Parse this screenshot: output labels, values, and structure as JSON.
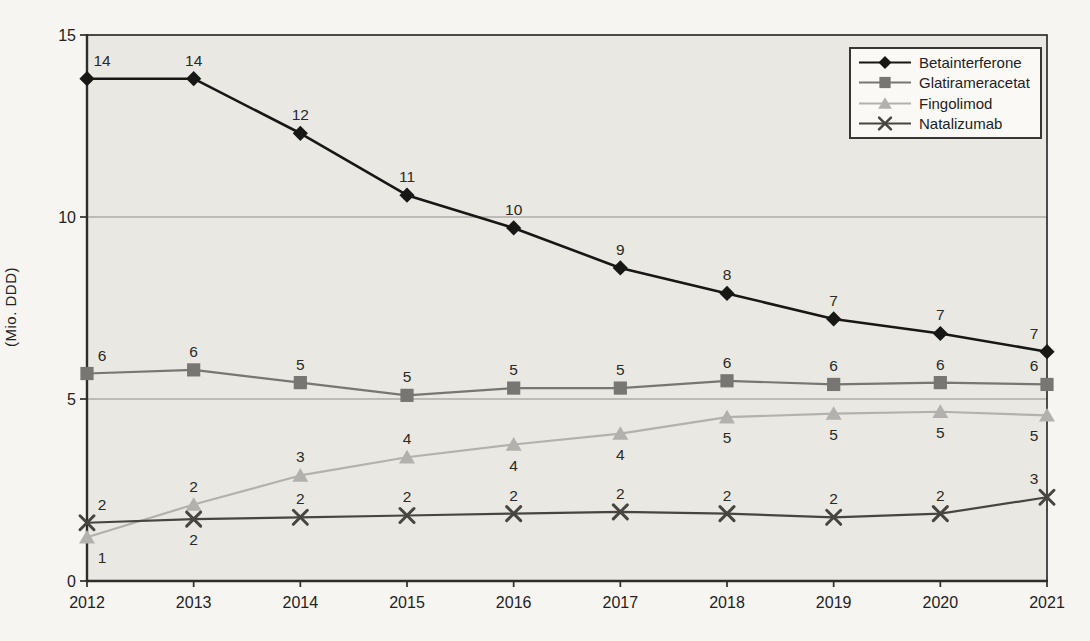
{
  "page": {
    "background": "#f6f5f1"
  },
  "chart_data": {
    "type": "line",
    "title": "",
    "xlabel": "",
    "ylabel": "(Mio. DDD)",
    "categories": [
      "2012",
      "2013",
      "2014",
      "2015",
      "2016",
      "2017",
      "2018",
      "2019",
      "2020",
      "2021"
    ],
    "ylim": [
      0,
      15
    ],
    "yticks": [
      0,
      5,
      10,
      15
    ],
    "gridlines": [
      5,
      10
    ],
    "grid": true,
    "legend_position": "top-right",
    "legend_items": [
      "Betainterferone",
      "Glatirameracetat",
      "Fingolimod",
      "Natalizumab"
    ],
    "plot_bg": "#e9e8e3",
    "axis_color": "#2e2d2a",
    "grid_color": "#8f8d88",
    "series": [
      {
        "name": "Betainterferone",
        "marker": "diamond",
        "color": "#171715",
        "line_width": 2.6,
        "values": [
          13.8,
          13.8,
          12.3,
          10.6,
          9.7,
          8.6,
          7.9,
          7.2,
          6.8,
          6.3
        ],
        "labels": [
          "14",
          "14",
          "12",
          "11",
          "10",
          "9",
          "8",
          "7",
          "7",
          "7"
        ],
        "label_side": [
          "above",
          "above",
          "above",
          "above",
          "above",
          "above",
          "above",
          "above",
          "above",
          "above"
        ]
      },
      {
        "name": "Glatirameracetat",
        "marker": "square",
        "color": "#787673",
        "line_width": 2.2,
        "values": [
          5.7,
          5.8,
          5.45,
          5.1,
          5.3,
          5.3,
          5.5,
          5.4,
          5.45,
          5.4
        ],
        "labels": [
          "6",
          "6",
          "5",
          "5",
          "5",
          "5",
          "6",
          "6",
          "6",
          "6"
        ],
        "label_side": [
          "above",
          "above",
          "above",
          "above",
          "above",
          "above",
          "above",
          "above",
          "above",
          "above"
        ]
      },
      {
        "name": "Fingolimod",
        "marker": "triangle",
        "color": "#b3b1ad",
        "line_width": 2.2,
        "values": [
          1.2,
          2.1,
          2.9,
          3.4,
          3.75,
          4.05,
          4.5,
          4.6,
          4.65,
          4.55
        ],
        "labels": [
          "1",
          "2",
          "3",
          "4",
          "4",
          "4",
          "5",
          "5",
          "5",
          "5"
        ],
        "label_side": [
          "below",
          "above",
          "above",
          "above",
          "below",
          "below",
          "below",
          "below",
          "below",
          "below"
        ]
      },
      {
        "name": "Natalizumab",
        "marker": "x",
        "color": "#47453f",
        "line_width": 2.2,
        "values": [
          1.6,
          1.7,
          1.75,
          1.8,
          1.85,
          1.9,
          1.85,
          1.75,
          1.85,
          2.3
        ],
        "labels": [
          "2",
          "2",
          "2",
          "2",
          "2",
          "2",
          "2",
          "2",
          "2",
          "3"
        ],
        "label_side": [
          "above",
          "below",
          "above",
          "above",
          "above",
          "above",
          "above",
          "above",
          "above",
          "above"
        ]
      }
    ]
  }
}
